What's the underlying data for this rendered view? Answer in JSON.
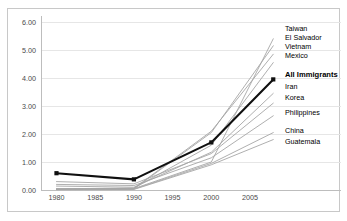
{
  "chart_data": {
    "type": "line",
    "title": "",
    "xlabel": "",
    "ylabel": "",
    "x": [
      1980,
      1990,
      2000,
      2008
    ],
    "xlim": [
      1978,
      2009
    ],
    "ylim": [
      0,
      6
    ],
    "xticks": [
      "1980",
      "1985",
      "1990",
      "1995",
      "2000",
      "2005"
    ],
    "xtick_values": [
      1980,
      1985,
      1990,
      1995,
      2000,
      2005
    ],
    "yticks": [
      "0.00",
      "1.00",
      "2.00",
      "3.00",
      "4.00",
      "5.00",
      "6.00"
    ],
    "ytick_values": [
      0,
      1,
      2,
      3,
      4,
      5,
      6
    ],
    "grid": true,
    "legend_position": "right-end-of-line",
    "series": [
      {
        "name": "Taiwan",
        "values": [
          0.05,
          0.05,
          1.0,
          5.4
        ],
        "highlight": false,
        "label_y": 26
      },
      {
        "name": "El Salvador",
        "values": [
          0.02,
          0.04,
          2.05,
          5.15
        ],
        "highlight": false,
        "label_y": 35
      },
      {
        "name": "Vietnam",
        "values": [
          0.03,
          0.06,
          2.1,
          4.85
        ],
        "highlight": false,
        "label_y": 44
      },
      {
        "name": "Mexico",
        "values": [
          0.04,
          0.07,
          1.6,
          4.55
        ],
        "highlight": false,
        "label_y": 53
      },
      {
        "name": "All Immigrants",
        "values": [
          0.6,
          0.38,
          1.7,
          3.95
        ],
        "highlight": true,
        "label_y": 72
      },
      {
        "name": "Iran",
        "values": [
          0.14,
          0.1,
          1.35,
          3.45
        ],
        "highlight": false,
        "label_y": 84
      },
      {
        "name": "Korea",
        "values": [
          0.3,
          0.22,
          1.3,
          3.1
        ],
        "highlight": false,
        "label_y": 95
      },
      {
        "name": "Philippines",
        "values": [
          0.2,
          0.16,
          1.15,
          2.65
        ],
        "highlight": false,
        "label_y": 110
      },
      {
        "name": "China",
        "values": [
          0.02,
          0.03,
          0.95,
          2.05
        ],
        "highlight": false,
        "label_y": 128
      },
      {
        "name": "Guatemala",
        "values": [
          0.01,
          0.02,
          0.9,
          1.8
        ],
        "highlight": false,
        "label_y": 139
      }
    ]
  },
  "legend": {
    "items": [
      "Taiwan",
      "El Salvador",
      "Vietnam",
      "Mexico",
      "All Immigrants",
      "Iran",
      "Korea",
      "Philippines",
      "China",
      "Guatemala"
    ]
  },
  "colors": {
    "series": "#a6a6a6",
    "highlight": "#101010",
    "grid": "#e6e6e6",
    "axis": "#bdbdbd",
    "border": "#c8c8c8",
    "tick_text": "#4a4a4a",
    "legend_text": "#5a5a5a",
    "background": "#ffffff"
  }
}
